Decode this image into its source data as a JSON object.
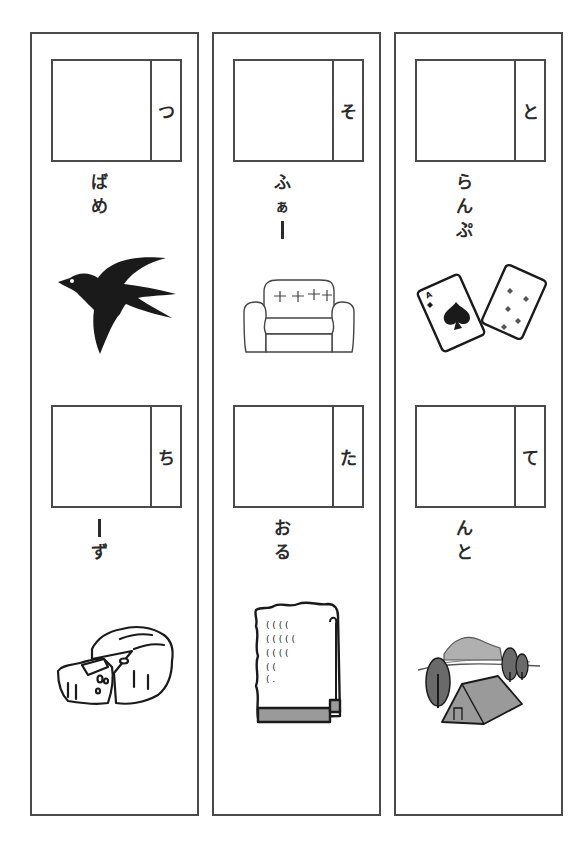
{
  "worksheet": {
    "columns": [
      {
        "items": [
          {
            "hint_char": "つ",
            "remaining": [
              "ば",
              "め"
            ],
            "picture": "swallow-bird"
          },
          {
            "hint_char": "ち",
            "remaining": [
              "ー",
              "ず"
            ],
            "picture": "cheese"
          }
        ]
      },
      {
        "items": [
          {
            "hint_char": "そ",
            "remaining": [
              "ふ",
              "ぁ",
              "ー"
            ],
            "picture": "sofa"
          },
          {
            "hint_char": "た",
            "remaining": [
              "お",
              "る"
            ],
            "picture": "towel"
          }
        ]
      },
      {
        "items": [
          {
            "hint_char": "と",
            "remaining": [
              "ら",
              "ん",
              "ぷ"
            ],
            "picture": "playing-cards"
          },
          {
            "hint_char": "て",
            "remaining": [
              "ん",
              "と"
            ],
            "picture": "tent-campsite"
          }
        ]
      }
    ]
  },
  "colors": {
    "border": "#4a4a4a",
    "ink": "#222222",
    "fill_gray": "#9a9a9a",
    "fill_dark_gray": "#6a6a6a"
  }
}
